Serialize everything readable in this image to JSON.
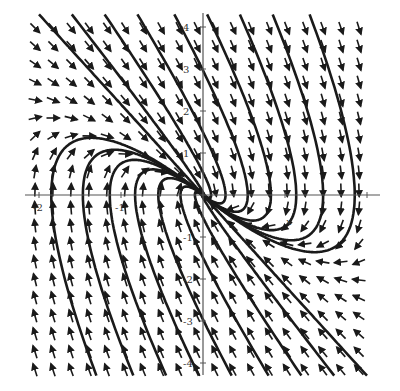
{
  "chart_data": {
    "type": "vector_field",
    "title": "",
    "xlabel": "x",
    "ylabel": "y",
    "system": {
      "dx": "y",
      "dy": "-4x - 4y"
    },
    "xlim": [
      -2.15,
      2.15
    ],
    "ylim": [
      -4.3,
      4.3
    ],
    "x_ticks": [
      -2,
      -1,
      1,
      2
    ],
    "x_tick_labels": [
      "-2",
      "-1",
      "",
      ""
    ],
    "y_ticks": [
      -4,
      -3,
      -2,
      -1,
      1,
      2,
      3,
      4
    ],
    "y_tick_labels": [
      "-4",
      "-3",
      "-2",
      "-1",
      "1",
      "2",
      "3",
      "4"
    ],
    "grid": false,
    "arrow_grid": {
      "nx": 19,
      "ny": 20
    },
    "colors": {
      "arrow": "#1a1a1a",
      "trajectory": "#1a1a1a",
      "axis": "#555555"
    },
    "trajectory_starts": [
      [
        -2.0,
        4.3
      ],
      [
        -1.6,
        4.3
      ],
      [
        -1.2,
        4.3
      ],
      [
        -0.8,
        4.3
      ],
      [
        -0.35,
        4.3
      ],
      [
        0.05,
        4.3
      ],
      [
        0.45,
        4.3
      ],
      [
        0.85,
        4.3
      ],
      [
        1.3,
        4.3
      ],
      [
        2.0,
        -4.3
      ],
      [
        1.6,
        -4.3
      ],
      [
        1.2,
        -4.3
      ],
      [
        0.8,
        -4.3
      ],
      [
        0.35,
        -4.3
      ],
      [
        -0.05,
        -4.3
      ],
      [
        -0.45,
        -4.3
      ],
      [
        -0.85,
        -4.3
      ],
      [
        -1.3,
        -4.3
      ]
    ]
  },
  "axes": {
    "x_axis_label": "x",
    "y_axis_label": "y"
  }
}
